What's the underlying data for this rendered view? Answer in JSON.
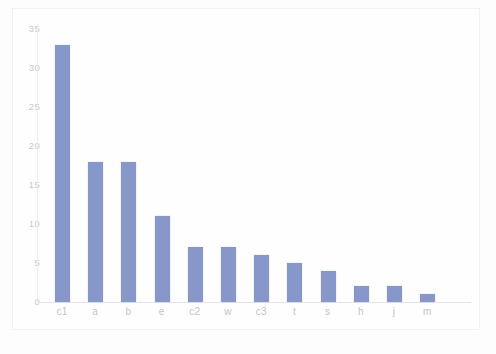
{
  "chart_data": {
    "type": "bar",
    "title": "",
    "subtitle": "",
    "xlabel": "",
    "ylabel": "",
    "categories": [
      "c1",
      "a",
      "b",
      "e",
      "c2",
      "w",
      "c3",
      "t",
      "s",
      "h",
      "j",
      "m"
    ],
    "values": [
      33,
      18,
      18,
      11,
      7,
      7,
      6,
      5,
      4,
      2,
      2,
      1
    ],
    "series": [
      {
        "name": "count",
        "values": [
          33,
          18,
          18,
          11,
          7,
          7,
          6,
          5,
          4,
          2,
          2,
          1
        ]
      }
    ],
    "ylim": [
      0,
      35
    ],
    "y_ticks": [
      0,
      5,
      10,
      15,
      20,
      25,
      30,
      35
    ],
    "y_tick_labels": [
      "0",
      "5",
      "10",
      "15",
      "20",
      "25",
      "30",
      "35"
    ],
    "x_tick_labels": [
      "c1",
      "a",
      "b",
      "e",
      "c2",
      "w",
      "c3",
      "t",
      "s",
      "h",
      "j",
      "m"
    ],
    "grid": false,
    "legend": null,
    "legend_position": "none",
    "bar_color": "#8897ca",
    "axis_color": "#e4e4e4",
    "tick_label_color": "#c4c4c4",
    "background_color": "#fdfdfd"
  }
}
